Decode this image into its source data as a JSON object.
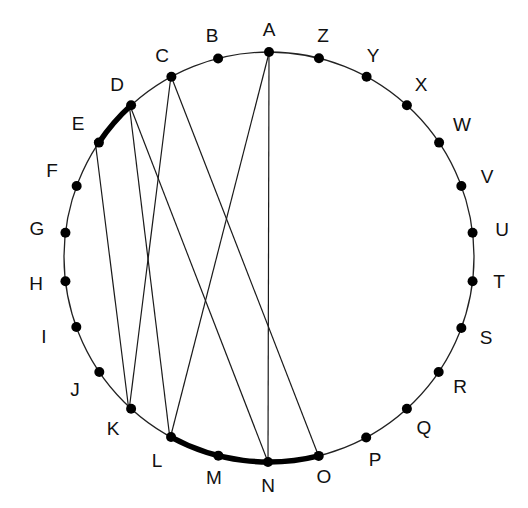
{
  "diagram": {
    "title": "",
    "type": "circular chord diagram",
    "center": [
      269,
      257
    ],
    "radius": 205,
    "colors": {
      "circle": "#222222",
      "chord": "#1a1a1a",
      "dot": "#000000",
      "label": "#111111",
      "highlight": "#000000"
    },
    "nodes": [
      {
        "id": "A",
        "label": "A",
        "x": 269,
        "y": 53,
        "lx": 269,
        "ly": 31
      },
      {
        "id": "B",
        "label": "B",
        "x": 218,
        "y": 58,
        "lx": 212,
        "ly": 37
      },
      {
        "id": "C",
        "label": "C",
        "x": 171,
        "y": 76,
        "lx": 162,
        "ly": 57
      },
      {
        "id": "D",
        "label": "D",
        "x": 129,
        "y": 103,
        "lx": 117,
        "ly": 86
      },
      {
        "id": "E",
        "label": "E",
        "x": 95,
        "y": 140,
        "lx": 78,
        "ly": 125
      },
      {
        "id": "F",
        "label": "F",
        "x": 71,
        "y": 184,
        "lx": 52,
        "ly": 172
      },
      {
        "id": "G",
        "label": "G",
        "x": 59,
        "y": 232,
        "lx": 37,
        "ly": 230
      },
      {
        "id": "H",
        "label": "H",
        "x": 59,
        "y": 282,
        "lx": 36,
        "ly": 285
      },
      {
        "id": "I",
        "label": "I",
        "x": 71,
        "y": 329,
        "lx": 44,
        "ly": 338
      },
      {
        "id": "J",
        "label": "J",
        "x": 95,
        "y": 375,
        "lx": 75,
        "ly": 391
      },
      {
        "id": "K",
        "label": "K",
        "x": 129,
        "y": 411,
        "lx": 113,
        "ly": 430
      },
      {
        "id": "L",
        "label": "L",
        "x": 170,
        "y": 439,
        "lx": 157,
        "ly": 462
      },
      {
        "id": "M",
        "label": "M",
        "x": 218,
        "y": 457,
        "lx": 214,
        "ly": 479
      },
      {
        "id": "N",
        "label": "N",
        "x": 268,
        "y": 462,
        "lx": 268,
        "ly": 487
      },
      {
        "id": "O",
        "label": "O",
        "x": 319,
        "y": 457,
        "lx": 324,
        "ly": 478
      },
      {
        "id": "P",
        "label": "P",
        "x": 367,
        "y": 439,
        "lx": 375,
        "ly": 461
      },
      {
        "id": "Q",
        "label": "Q",
        "x": 409,
        "y": 411,
        "lx": 424,
        "ly": 429
      },
      {
        "id": "R",
        "label": "R",
        "x": 443,
        "y": 375,
        "lx": 460,
        "ly": 388
      },
      {
        "id": "S",
        "label": "S",
        "x": 467,
        "y": 330,
        "lx": 486,
        "ly": 339
      },
      {
        "id": "T",
        "label": "T",
        "x": 479,
        "y": 282,
        "lx": 499,
        "ly": 283
      },
      {
        "id": "U",
        "label": "U",
        "x": 479,
        "y": 232,
        "lx": 502,
        "ly": 231
      },
      {
        "id": "V",
        "label": "V",
        "x": 467,
        "y": 184,
        "lx": 487,
        "ly": 178
      },
      {
        "id": "W",
        "label": "W",
        "x": 443,
        "y": 140,
        "lx": 462,
        "ly": 126
      },
      {
        "id": "X",
        "label": "X",
        "x": 409,
        "y": 103,
        "lx": 421,
        "ly": 86
      },
      {
        "id": "Y",
        "label": "Y",
        "x": 367,
        "y": 76,
        "lx": 373,
        "ly": 57
      },
      {
        "id": "Z",
        "label": "Z",
        "x": 319,
        "y": 58,
        "lx": 323,
        "ly": 37
      }
    ],
    "chords": [
      {
        "from": "A",
        "to": "L"
      },
      {
        "from": "A",
        "to": "N"
      },
      {
        "from": "C",
        "to": "K"
      },
      {
        "from": "C",
        "to": "O"
      },
      {
        "from": "D",
        "to": "L"
      },
      {
        "from": "D",
        "to": "N"
      },
      {
        "from": "E",
        "to": "K"
      }
    ],
    "highlighted_arcs": [
      {
        "from": "D",
        "to": "E"
      },
      {
        "from": "L",
        "to": "O"
      }
    ]
  }
}
